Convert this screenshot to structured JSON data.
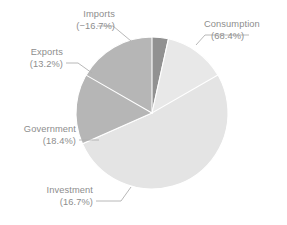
{
  "chart_data": {
    "type": "pie",
    "title": "",
    "subtitle": "",
    "xlabel": "",
    "ylabel": "",
    "legend_position": "none",
    "grid": false,
    "labels_outside": true,
    "categories": [
      "Consumption",
      "Investment",
      "Government",
      "Exports",
      "Imports"
    ],
    "values": [
      68.4,
      16.7,
      18.4,
      13.2,
      -16.7
    ],
    "display_values": [
      "(68.4%)",
      "(16.7%)",
      "(18.4%)",
      "(13.2%)",
      "(−16.7%)"
    ],
    "slice_colors": [
      "#e4e4e4",
      "#b6b6b6",
      "#919191",
      "#e8e8e8",
      "#b6b6b6"
    ],
    "slices": [
      {
        "name": "Consumption",
        "label": "Consumption",
        "value_label": "(68.4%)",
        "value": 68.4,
        "color": "#e4e4e4",
        "sweep_deg": 246.2,
        "start_deg": 0,
        "label_x": 204,
        "label_y": 27,
        "value_x": 211,
        "value_y": 39,
        "anchor": "start",
        "leader": "M 196,45 L 205,35 L 249,35"
      },
      {
        "name": "Investment",
        "label": "Investment",
        "value_label": "(16.7%)",
        "value": 16.7,
        "color": "#b6b6b6",
        "sweep_deg": 60.1,
        "start_deg": 246.2,
        "label_x": 93,
        "label_y": 193,
        "value_x": 93,
        "value_y": 205,
        "anchor": "end",
        "leader": "M 131,187 L 121,201 L 96,201"
      },
      {
        "name": "Government",
        "label": "Government",
        "value_label": "(18.4%)",
        "value": 18.4,
        "color": "#919191",
        "sweep_deg": 66.2,
        "start_deg": 306.3,
        "label_x": 76,
        "label_y": 132,
        "value_x": 76,
        "value_y": 144,
        "anchor": "end",
        "leader": "M 79,140 L 99,140"
      },
      {
        "name": "Exports",
        "label": "Exports",
        "value_label": "(13.2%)",
        "value": 13.2,
        "color": "#e8e8e8",
        "sweep_deg": 47.5,
        "start_deg": 12.5,
        "label_x": 63,
        "label_y": 55,
        "value_x": 63,
        "value_y": 67,
        "anchor": "end",
        "leader": "M 66,63 L 78,63 L 92,73"
      },
      {
        "name": "Imports",
        "label": "Imports",
        "value_label": "(−16.7%)",
        "value": -16.7,
        "color": "#b6b6b6",
        "sweep_deg": 60.1,
        "start_deg": 299.9,
        "label_x": 115,
        "label_y": 17,
        "value_x": 115,
        "value_y": 29,
        "anchor": "end",
        "leader": "M 97,26 L 113,26 L 131,41"
      }
    ],
    "geometry": {
      "center_x": 152,
      "center_y": 113,
      "radius": 76
    }
  }
}
